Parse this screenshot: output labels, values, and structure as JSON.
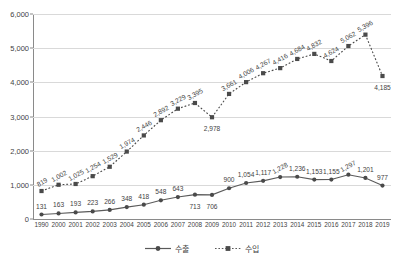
{
  "chart_data": {
    "type": "line",
    "title": "",
    "xlabel": "",
    "ylabel": "",
    "ylim": [
      0,
      6000
    ],
    "ytick_labels": [
      "0",
      "1,000",
      "2,000",
      "3,000",
      "4,000",
      "5,000",
      "6,000"
    ],
    "ytick_values": [
      0,
      1000,
      2000,
      3000,
      4000,
      5000,
      6000
    ],
    "grid": true,
    "legend_position": "bottom",
    "categories": [
      "1990",
      "2000",
      "2001",
      "2002",
      "2003",
      "2004",
      "2005",
      "2006",
      "2007",
      "2008",
      "2009",
      "2010",
      "2011",
      "2012",
      "2013",
      "2014",
      "2015",
      "2016",
      "2017",
      "2018",
      "2019"
    ],
    "series": [
      {
        "name": "수출",
        "marker": "circle",
        "line_style": "solid",
        "color": "#5a5a5a",
        "values": [
          131,
          163,
          193,
          223,
          266,
          348,
          418,
          548,
          643,
          713,
          706,
          900,
          1054,
          1117,
          1228,
          1236,
          1153,
          1155,
          1297,
          1201,
          977
        ],
        "labels": [
          "131",
          "163",
          "193",
          "223",
          "266",
          "348",
          "418",
          "548",
          "643",
          "713",
          "706",
          "900",
          "1,054",
          "1,117",
          "1,228",
          "1,236",
          "1,153",
          "1,155",
          "1,297",
          "1,201",
          "977"
        ]
      },
      {
        "name": "수입",
        "marker": "square",
        "line_style": "dotted",
        "color": "#4a4a4a",
        "values": [
          819,
          1002,
          1025,
          1254,
          1529,
          1974,
          2446,
          2892,
          3229,
          3395,
          2978,
          3661,
          4006,
          4267,
          4416,
          4684,
          4832,
          4624,
          5062,
          5396,
          4185
        ],
        "labels": [
          "819",
          "1,002",
          "1,025",
          "1,254",
          "1,529",
          "1,974",
          "2,446",
          "2,892",
          "3,229",
          "3,395",
          "2,978",
          "3,661",
          "4,006",
          "4,267",
          "4,416",
          "4,684",
          "4,832",
          "4,624",
          "5,062",
          "5,396",
          "4,185"
        ]
      }
    ]
  },
  "legend": {
    "items": [
      {
        "label": "수출",
        "marker": "circle-marker-icon"
      },
      {
        "label": "수입",
        "marker": "square-marker-icon"
      }
    ]
  }
}
